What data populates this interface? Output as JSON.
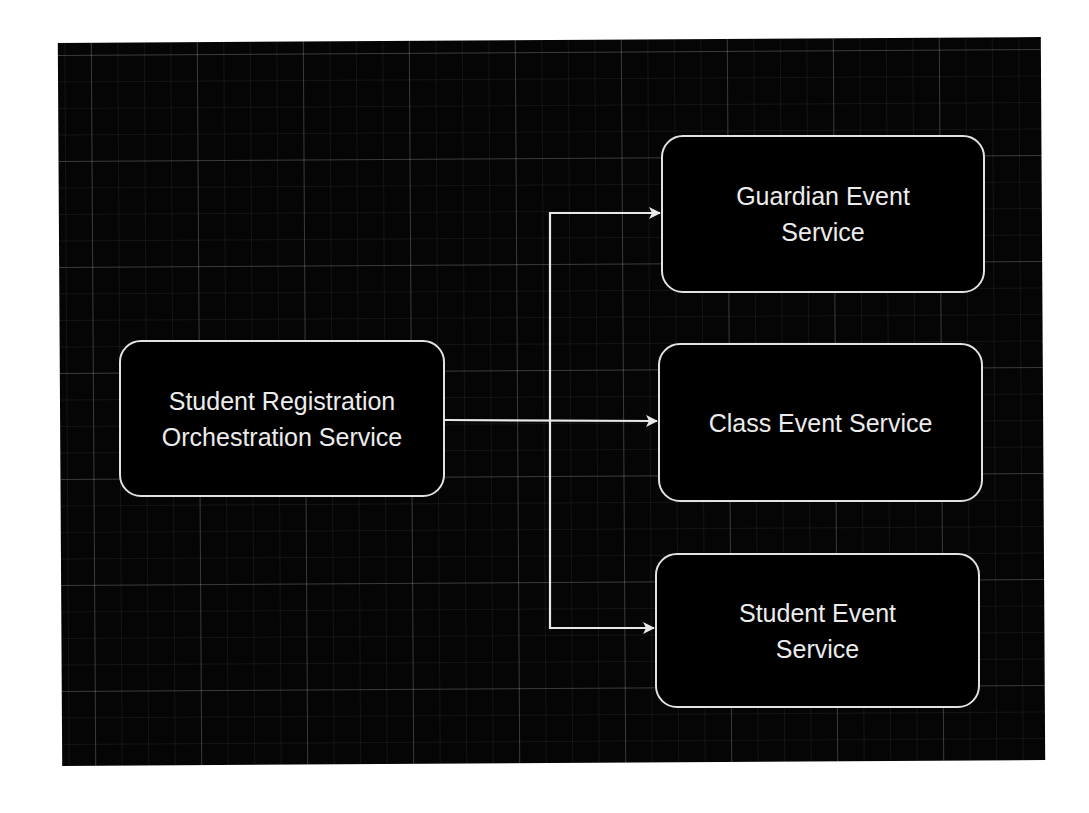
{
  "diagram": {
    "title": "",
    "background": {
      "canvas_color": "#050505",
      "page_color": "#ffffff",
      "grid": true
    },
    "nodes": [
      {
        "id": "orchestrator",
        "label": "Student Registration\nOrchestration Service",
        "shape": "rounded-rectangle",
        "stroke": "#e2e2e2",
        "fill": "#000000"
      },
      {
        "id": "guardian",
        "label": "Guardian Event\nService",
        "shape": "rounded-rectangle",
        "stroke": "#e2e2e2",
        "fill": "#000000"
      },
      {
        "id": "class",
        "label": "Class Event Service",
        "shape": "rounded-rectangle",
        "stroke": "#e2e2e2",
        "fill": "#000000"
      },
      {
        "id": "student",
        "label": "Student Event\nService",
        "shape": "rounded-rectangle",
        "stroke": "#e2e2e2",
        "fill": "#000000"
      }
    ],
    "edges": [
      {
        "from": "orchestrator",
        "to": "guardian",
        "style": "orthogonal-arrow",
        "color": "#e8e8e8"
      },
      {
        "from": "orchestrator",
        "to": "class",
        "style": "straight-arrow",
        "color": "#e8e8e8"
      },
      {
        "from": "orchestrator",
        "to": "student",
        "style": "orthogonal-arrow",
        "color": "#e8e8e8"
      }
    ]
  }
}
